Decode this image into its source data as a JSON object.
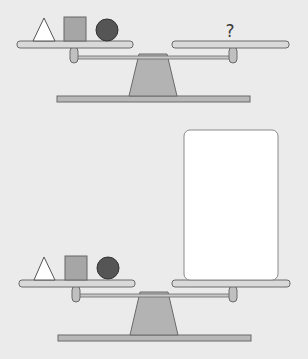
{
  "scenes": [
    {
      "id": "scale-top",
      "left_pan": {
        "items": [
          "triangle",
          "square",
          "circle"
        ]
      },
      "right_pan": {
        "content": "?"
      }
    },
    {
      "id": "scale-bottom",
      "left_pan": {
        "items": [
          "triangle",
          "square",
          "circle"
        ]
      },
      "right_pan": {
        "content": "answer-card",
        "card_text": ""
      }
    }
  ],
  "colors": {
    "background": "#ebebeb",
    "pan_fill": "#d9d9d9",
    "stroke": "#666666",
    "fulcrum": "#b3b3b3",
    "square": "#a6a6a6",
    "circle": "#555555",
    "triangle_fill": "#ffffff",
    "card": "#ffffff"
  }
}
